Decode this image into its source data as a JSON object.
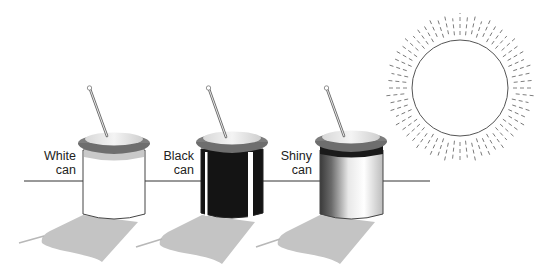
{
  "figure": {
    "cans": [
      {
        "id": "white",
        "label_line1": "White",
        "label_line2": "can",
        "body_color": "#ffffff"
      },
      {
        "id": "black",
        "label_line1": "Black",
        "label_line2": "can",
        "body_color": "#111111"
      },
      {
        "id": "shiny",
        "label_line1": "Shiny",
        "label_line2": "can",
        "body_color": "#c8c8c8"
      }
    ],
    "sun": {
      "label": ""
    },
    "colors": {
      "shadow": "#c4c4c4",
      "lid_rim": "#7d7d7d",
      "lid_top": "#bdbdbd",
      "horizon": "#333333"
    }
  }
}
